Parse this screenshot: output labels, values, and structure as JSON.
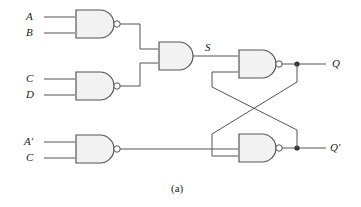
{
  "figure": {
    "caption": "(a)",
    "background_color": "#ffffff",
    "line_color": "#4a4a4a",
    "gate_fill": "#f2f2f2",
    "gate_stroke": "#555555",
    "text_color": "#1a1a1a"
  },
  "inputs": [
    {
      "id": "in-a",
      "label": "A",
      "x": 30,
      "y": 16
    },
    {
      "id": "in-b",
      "label": "B",
      "x": 30,
      "y": 32
    },
    {
      "id": "in-c1",
      "label": "C",
      "x": 30,
      "y": 78
    },
    {
      "id": "in-d",
      "label": "D",
      "x": 30,
      "y": 94
    },
    {
      "id": "in-anot",
      "label": "A′",
      "x": 28,
      "y": 141
    },
    {
      "id": "in-c2",
      "label": "C",
      "x": 30,
      "y": 157
    }
  ],
  "internal_signals": [
    {
      "id": "sig-s",
      "label": "S",
      "x": 207,
      "y": 47
    }
  ],
  "outputs": [
    {
      "id": "out-q",
      "label": "Q",
      "x": 332,
      "y": 58
    },
    {
      "id": "out-qnot",
      "label": "Q′",
      "x": 330,
      "y": 141
    }
  ],
  "gates": [
    {
      "id": "gate-nand-ab",
      "type": "NAND",
      "label": "NAND A B",
      "inputs": [
        "A",
        "B"
      ],
      "output": "intermediate"
    },
    {
      "id": "gate-nand-cd",
      "type": "NAND",
      "label": "NAND C D",
      "inputs": [
        "C",
        "D"
      ],
      "output": "intermediate"
    },
    {
      "id": "gate-and-s",
      "type": "AND",
      "label": "AND S",
      "inputs": [
        "NAND A B",
        "NAND C D"
      ],
      "output": "S"
    },
    {
      "id": "gate-nand-q",
      "type": "NAND",
      "label": "NAND set",
      "inputs": [
        "S",
        "Q′"
      ],
      "output": "Q"
    },
    {
      "id": "gate-nand-anot-c",
      "type": "NAND",
      "label": "NAND A' C",
      "inputs": [
        "A′",
        "C"
      ],
      "output": "reset"
    },
    {
      "id": "gate-nand-qnot",
      "type": "NAND",
      "label": "NAND reset",
      "inputs": [
        "NAND A' C",
        "Q"
      ],
      "output": "Q′"
    }
  ],
  "junctions": [
    {
      "id": "junction-q",
      "x": 297,
      "y": 64
    },
    {
      "id": "junction-qnot",
      "x": 297,
      "y": 148
    }
  ]
}
